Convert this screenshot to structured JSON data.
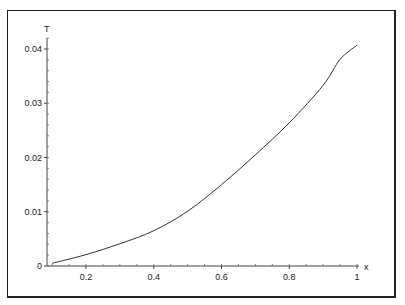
{
  "chart_data": {
    "type": "line",
    "title": "",
    "xlabel": "x",
    "ylabel": "T",
    "xlim": [
      0.085,
      1.0
    ],
    "ylim": [
      0,
      0.041
    ],
    "grid": false,
    "x_ticks": [
      "0.2",
      "0.4",
      "0.6",
      "0.8",
      "1"
    ],
    "y_ticks": [
      "0",
      "0.01",
      "0.02",
      "0.03",
      "0.04"
    ],
    "series": [
      {
        "name": "T(x)",
        "x": [
          0.1,
          0.2,
          0.3,
          0.4,
          0.5,
          0.6,
          0.7,
          0.8,
          0.9,
          0.95,
          1.0
        ],
        "y": [
          0.0005,
          0.0021,
          0.0041,
          0.0065,
          0.0101,
          0.015,
          0.0205,
          0.0264,
          0.0333,
          0.0381,
          0.0407
        ]
      }
    ],
    "line_color": "#333333"
  }
}
